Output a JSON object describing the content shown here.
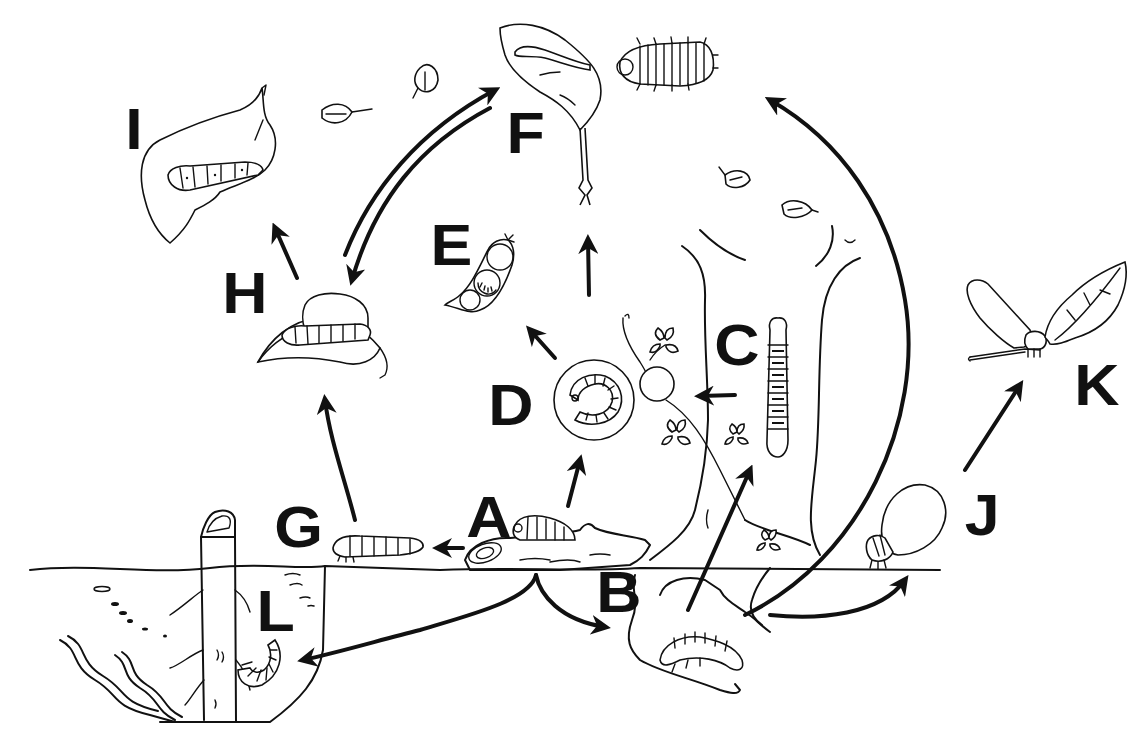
{
  "figure": {
    "type": "life-cycle-diagram",
    "style": "black-and-white line illustration",
    "background": "#ffffff",
    "ink": "#111111"
  },
  "labels": {
    "A": "A",
    "B": "B",
    "C": "C",
    "D": "D",
    "E": "E",
    "F": "F",
    "G": "G",
    "H": "H",
    "I": "I",
    "J": "J",
    "K": "K",
    "L": "L"
  },
  "stages": [
    {
      "label": "A",
      "depicts": "larva on fallen log at ground level, egg beside it"
    },
    {
      "label": "B",
      "depicts": "larva in underground soil chamber"
    },
    {
      "label": "C",
      "depicts": "segmented larva on tree trunk"
    },
    {
      "label": "D",
      "depicts": "curled larva inside round gall on plant stem"
    },
    {
      "label": "E",
      "depicts": "larva inside seed pod"
    },
    {
      "label": "F",
      "depicts": "leaf-mining larva in leaf and isopod-like larva"
    },
    {
      "label": "G",
      "depicts": "larva crawling on ground surface"
    },
    {
      "label": "H",
      "depicts": "larva with frothy covering on leaf"
    },
    {
      "label": "I",
      "depicts": "larva feeding on chewed leaf"
    },
    {
      "label": "J",
      "depicts": "adult with stippled wings on ground"
    },
    {
      "label": "K",
      "depicts": "adult with stippled wings on twig beside leaf"
    },
    {
      "label": "L",
      "depicts": "curled larva in water beside submerged stem"
    }
  ],
  "arrows": [
    {
      "from": "A",
      "to": "G"
    },
    {
      "from": "A",
      "to": "D"
    },
    {
      "from": "A",
      "to": "B"
    },
    {
      "from": "A",
      "to": "L"
    },
    {
      "from": "G",
      "to": "H"
    },
    {
      "from": "H",
      "to": "I"
    },
    {
      "from": "H",
      "to": "F",
      "bidirectional": true
    },
    {
      "from": "D",
      "to": "E"
    },
    {
      "from": "D",
      "to": "F"
    },
    {
      "from": "C",
      "to": "D"
    },
    {
      "from": "B",
      "to": "C"
    },
    {
      "from": "B",
      "to": "F"
    },
    {
      "from": "B",
      "to": "J"
    },
    {
      "from": "J",
      "to": "K"
    }
  ]
}
